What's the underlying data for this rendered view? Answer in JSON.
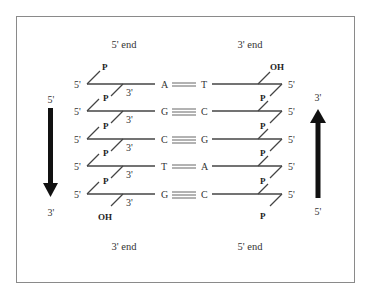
{
  "diagram": {
    "left_strand": {
      "top_label": "5' end",
      "bottom_label": "3' end",
      "arrow": {
        "start": "5'",
        "end": "3'",
        "direction": "down"
      },
      "top_group": "P",
      "bottom_group": "OH",
      "row_end_label": "5'",
      "link_label": "3'",
      "link_group": "P"
    },
    "right_strand": {
      "top_label": "3' end",
      "bottom_label": "5' end",
      "arrow": {
        "start": "5'",
        "end": "3'",
        "direction": "up"
      },
      "top_group": "OH",
      "bottom_group": "P",
      "row_end_label": "5'",
      "link_group": "P"
    },
    "base_pairs": [
      {
        "left": "A",
        "right": "T",
        "bonds": 2
      },
      {
        "left": "G",
        "right": "C",
        "bonds": 3
      },
      {
        "left": "C",
        "right": "G",
        "bonds": 3
      },
      {
        "left": "T",
        "right": "A",
        "bonds": 2
      },
      {
        "left": "G",
        "right": "C",
        "bonds": 3
      }
    ],
    "colors": {
      "line": "#444444",
      "arrow": "#111111",
      "frame": "#8a8a8a",
      "text": "#333333"
    }
  }
}
